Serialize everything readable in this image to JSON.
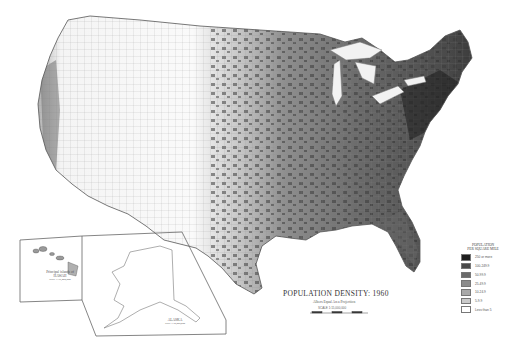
{
  "map": {
    "title": "POPULATION DENSITY: 1960",
    "subtitle": "Albers Equal Area Projection",
    "scale": "SCALE 1:15,000,000",
    "scale_ticks": [
      "0",
      "100",
      "200",
      "300",
      "400 Miles"
    ],
    "region": "Conterminous United States by county"
  },
  "legend": {
    "title_line1": "POPULATION",
    "title_line2": "PER SQUARE MILE",
    "items": [
      {
        "label": "250 or more",
        "color": "#1e1e1e"
      },
      {
        "label": "100-249.9",
        "color": "#4a4a4a"
      },
      {
        "label": "50-99.9",
        "color": "#6b6b6b"
      },
      {
        "label": "25-49.9",
        "color": "#8c8c8c"
      },
      {
        "label": "10-24.9",
        "color": "#a9a9a9"
      },
      {
        "label": "5-9.9",
        "color": "#cacaca"
      },
      {
        "label": "Less than 5",
        "color": "#ffffff"
      }
    ]
  },
  "insets": {
    "hawaii": {
      "caption_line1": "Principal islands of",
      "caption_line2": "HAWAII",
      "scale": "Scale 1:15,000,000"
    },
    "alaska": {
      "caption": "ALASKA",
      "scale": "Scale 1:30,000,000"
    }
  }
}
